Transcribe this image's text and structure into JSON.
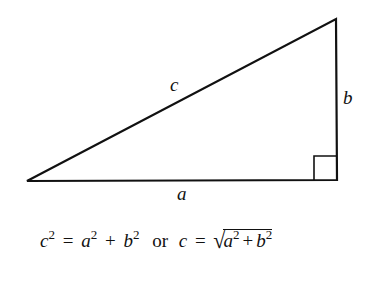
{
  "diagram": {
    "stroke_color": "#111111",
    "background": "#ffffff",
    "vertices": {
      "left": [
        27,
        181
      ],
      "bottom_right": [
        337,
        180
      ],
      "top_right": [
        336,
        19
      ]
    },
    "right_angle_marker": {
      "x": 314,
      "y": 157,
      "size": 23
    },
    "labels": {
      "hypotenuse": "c",
      "vertical_leg": "b",
      "horizontal_leg": "a"
    }
  },
  "formula": {
    "lhs_var": "c",
    "lhs_exp": "2",
    "equals": "=",
    "term1_var": "a",
    "term1_exp": "2",
    "plus": "+",
    "term2_var": "b",
    "term2_exp": "2",
    "connector": "or",
    "alt_lhs_var": "c",
    "alt_equals": "=",
    "radical": "√",
    "rad_term1_var": "a",
    "rad_term1_exp": "2",
    "rad_plus": "+",
    "rad_term2_var": "b",
    "rad_term2_exp": "2"
  }
}
